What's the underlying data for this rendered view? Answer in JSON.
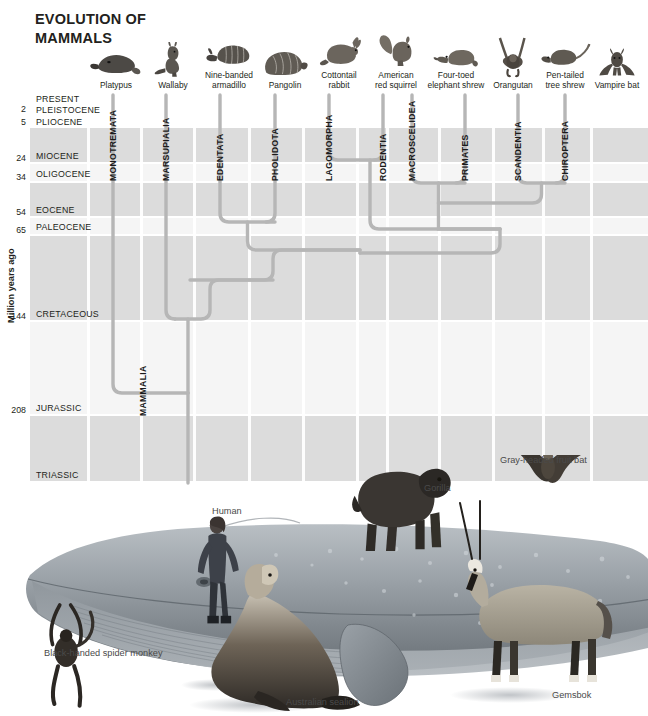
{
  "title": "EVOLUTION OF\nMAMMALS",
  "axis": {
    "ylabel": "Million years ago",
    "epochs": [
      {
        "name": "PRESENT",
        "tick": "",
        "top": 0,
        "height": 11,
        "shade": "white"
      },
      {
        "name": "PLEISTOCENE",
        "tick": "2",
        "top": 11,
        "height": 11,
        "shade": "white"
      },
      {
        "name": "PLIOCENE",
        "tick": "5",
        "top": 22,
        "height": 13,
        "shade": "white"
      },
      {
        "name": "MIOCENE",
        "tick": "24",
        "top": 35,
        "height": 36,
        "shade": "dark"
      },
      {
        "name": "OLIGOCENE",
        "tick": "34",
        "top": 71,
        "height": 19,
        "shade": "light"
      },
      {
        "name": "EOCENE",
        "tick": "54",
        "top": 90,
        "height": 35,
        "shade": "dark"
      },
      {
        "name": "PALEOCENE",
        "tick": "65",
        "top": 125,
        "height": 18,
        "shade": "light"
      },
      {
        "name": "CRETACEOUS",
        "tick": "144",
        "top": 143,
        "height": 86,
        "shade": "dark"
      },
      {
        "name": "JURASSIC",
        "tick": "208",
        "top": 229,
        "height": 94,
        "shade": "light"
      },
      {
        "name": "TRIASSIC",
        "tick": "",
        "top": 323,
        "height": 67,
        "shade": "dark"
      }
    ]
  },
  "root_clade": "MAMMALIA",
  "columns": [
    {
      "order": "MONOTREMATA",
      "animal": "Platypus",
      "icon": "platypus-icon",
      "x": 83,
      "hx": 35,
      "split_top": 286
    },
    {
      "order": "MARSUPIALIA",
      "animal": "Wallaby",
      "icon": "wallaby-icon",
      "x": 136,
      "hx": 92,
      "split_top": 249
    },
    {
      "order": "EDENTATA",
      "animal": "Nine-banded\narmadillo",
      "icon": "armadillo-icon",
      "x": 190,
      "hx": 148,
      "split_top": 129
    },
    {
      "order": "PHOLIDOTA",
      "animal": "Pangolin",
      "icon": "pangolin-icon",
      "x": 245,
      "hx": 204,
      "split_top": 129
    },
    {
      "order": "LAGOMORPHA",
      "animal": "Cottontail\nrabbit",
      "icon": "rabbit-icon",
      "x": 299,
      "hx": 258,
      "split_top": 67
    },
    {
      "order": "RODENTIA",
      "animal": "American\nred squirrel",
      "icon": "squirrel-icon",
      "x": 353,
      "hx": 315,
      "split_top": 67
    },
    {
      "order": "MACROSCELIDEA",
      "animal": "Four-toed\nelephant shrew",
      "icon": "elephant-shrew-icon",
      "x": 382,
      "hx": 375,
      "split_top": 90
    },
    {
      "order": "PRIMATES",
      "animal": "Orangutan",
      "icon": "orangutan-icon",
      "x": 435,
      "hx": 432,
      "split_top": 90
    },
    {
      "order": "SCANDENTIA",
      "animal": "Pen-tailed\ntree shrew",
      "icon": "tree-shrew-icon",
      "x": 488,
      "hx": 484,
      "split_top": 90
    },
    {
      "order": "CHIROPTERA",
      "animal": "Vampire bat",
      "icon": "vampire-bat-icon",
      "x": 535,
      "hx": 536,
      "split_top": 90
    }
  ],
  "scene": {
    "labels": [
      {
        "text": "Human",
        "left": 212,
        "top": 506,
        "name": "human-label"
      },
      {
        "text": "Gorilla",
        "left": 424,
        "top": 483,
        "name": "gorilla-label"
      },
      {
        "text": "Gray-headed fruit bat",
        "left": 500,
        "top": 455,
        "name": "fruit-bat-label"
      },
      {
        "text": "Black-handed spider monkey",
        "left": 44,
        "top": 648,
        "name": "spider-monkey-label"
      },
      {
        "text": "Australian sealion",
        "left": 286,
        "top": 697,
        "name": "sealion-label"
      },
      {
        "text": "Gemsbok",
        "left": 552,
        "top": 690,
        "name": "gemsbok-label"
      }
    ]
  },
  "colors": {
    "branch": "#b6b6b6",
    "band_dark": "#dcdcdc",
    "band_light": "#f5f5f5",
    "whale_body": "#9aa0a5",
    "text": "#231f20"
  },
  "chart_data": {
    "type": "diagram",
    "title": "EVOLUTION OF MAMMALS",
    "ylabel": "Million years ago",
    "ylim": [
      0,
      250
    ],
    "tick_values": [
      2,
      5,
      24,
      34,
      54,
      65,
      144,
      208
    ],
    "categories": [
      "MONOTREMATA",
      "MARSUPIALIA",
      "EDENTATA",
      "PHOLIDOTA",
      "LAGOMORPHA",
      "RODENTIA",
      "MACROSCELIDEA",
      "PRIMATES",
      "SCANDENTIA",
      "CHIROPTERA"
    ],
    "divergence_mya": [
      {
        "clade": "MAMMALIA root",
        "mya": 215
      },
      {
        "clade": "Monotremata split",
        "mya": 190
      },
      {
        "clade": "Marsupialia / Placentalia",
        "mya": 150
      },
      {
        "clade": "Edentata / Pholidota",
        "mya": 52
      },
      {
        "clade": "Lagomorpha / Rodentia",
        "mya": 46
      },
      {
        "clade": "Macroscelidea / Primates",
        "mya": 62
      },
      {
        "clade": "Scandentia / Chiroptera",
        "mya": 62
      },
      {
        "clade": "Glires / Archonta",
        "mya": 82
      }
    ],
    "grid": true,
    "legend": "none"
  }
}
